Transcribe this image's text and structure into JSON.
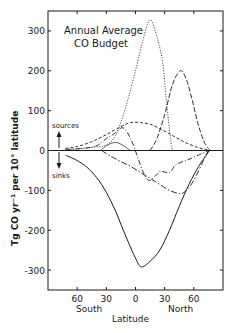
{
  "chart_data": {
    "type": "line",
    "title": "Annual Average",
    "subtitle": "CO Budget",
    "xlabel": "Latitude",
    "ylabel": "Tg CO yr⁻¹ per 10° latitude",
    "xlim": [
      -90,
      90
    ],
    "ylim": [
      -350,
      350
    ],
    "grid": false,
    "x_ticks": [
      {
        "value": -60,
        "label": "60"
      },
      {
        "value": -30,
        "label": "30"
      },
      {
        "value": 0,
        "label": "0"
      },
      {
        "value": 30,
        "label": "30"
      },
      {
        "value": 60,
        "label": "60"
      }
    ],
    "x_region_labels": {
      "south": "South",
      "north": "North"
    },
    "y_ticks": [
      {
        "value": 300,
        "label": "300"
      },
      {
        "value": 200,
        "label": "200"
      },
      {
        "value": 100,
        "label": "100"
      },
      {
        "value": 0,
        "label": "0"
      },
      {
        "value": -100,
        "label": "-100"
      },
      {
        "value": -200,
        "label": "-200"
      },
      {
        "value": -300,
        "label": "-300"
      }
    ],
    "annotations": {
      "sources": "sources",
      "sinks": "sinks"
    },
    "series": [
      {
        "name": "solid",
        "style": "solid",
        "x": [
          -72,
          -60,
          -50,
          -40,
          -30,
          -20,
          -10,
          0,
          6,
          15,
          25,
          35,
          45,
          55,
          65,
          72,
          76
        ],
        "y": [
          -12,
          -25,
          -42,
          -68,
          -105,
          -155,
          -215,
          -270,
          -292,
          -278,
          -250,
          -200,
          -140,
          -85,
          -40,
          -15,
          0
        ]
      },
      {
        "name": "dotted",
        "style": "dotted",
        "x": [
          -72,
          -60,
          -45,
          -30,
          -20,
          -10,
          0,
          8,
          15,
          22,
          28,
          32,
          36,
          38
        ],
        "y": [
          2,
          4,
          8,
          14,
          40,
          110,
          200,
          280,
          328,
          285,
          220,
          120,
          30,
          0
        ]
      },
      {
        "name": "long-dash",
        "style": "longdash",
        "x": [
          15,
          22,
          30,
          38,
          46,
          52,
          58,
          64,
          70,
          74,
          77
        ],
        "y": [
          0,
          30,
          90,
          165,
          200,
          180,
          130,
          70,
          25,
          8,
          0
        ]
      },
      {
        "name": "short-dash",
        "style": "shortdash",
        "x": [
          -72,
          -60,
          -45,
          -30,
          -15,
          -5,
          5,
          15,
          25,
          35,
          45,
          55,
          65,
          72,
          76
        ],
        "y": [
          5,
          10,
          22,
          40,
          60,
          70,
          70,
          66,
          55,
          42,
          28,
          16,
          7,
          3,
          0
        ]
      },
      {
        "name": "dash-dot",
        "style": "dashdot",
        "x": [
          -72,
          -55,
          -40,
          -30,
          -22,
          -13,
          -5,
          2,
          8,
          14,
          22,
          26,
          35,
          42,
          55,
          68,
          76
        ],
        "y": [
          3,
          5,
          12,
          30,
          42,
          57,
          30,
          -15,
          -55,
          -75,
          -60,
          -52,
          -55,
          -35,
          -22,
          -8,
          0
        ]
      },
      {
        "name": "dash-dot-long",
        "style": "dashdotlong",
        "x": [
          -35,
          -25,
          -15,
          -5,
          5,
          15,
          25,
          35,
          45,
          50,
          56,
          62,
          68,
          72,
          76
        ],
        "y": [
          0,
          -15,
          -28,
          -40,
          -55,
          -70,
          -85,
          -100,
          -108,
          -105,
          -90,
          -65,
          -35,
          -12,
          0
        ]
      },
      {
        "name": "fine-arc",
        "style": "thin",
        "x": [
          -36,
          -30,
          -25,
          -20,
          -15,
          -10,
          -5
        ],
        "y": [
          0,
          12,
          18,
          20,
          16,
          8,
          0
        ]
      }
    ]
  }
}
